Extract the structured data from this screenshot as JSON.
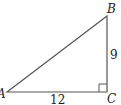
{
  "figure": {
    "type": "right-triangle",
    "vertices": {
      "A": {
        "label": "A",
        "x": 7,
        "y": 92
      },
      "B": {
        "label": "B",
        "x": 107,
        "y": 16
      },
      "C": {
        "label": "C",
        "x": 107,
        "y": 92
      }
    },
    "sides": {
      "AC": {
        "label": "12"
      },
      "BC": {
        "label": "9"
      }
    },
    "right_angle_at": "C",
    "stroke_color": "#555555"
  }
}
